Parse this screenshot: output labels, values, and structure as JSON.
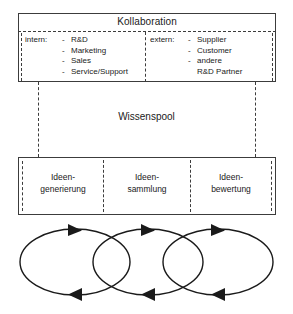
{
  "diagram": {
    "title": "Kollaboration",
    "collaboration": {
      "title": "Kollaboration",
      "internal": {
        "label": "intern:",
        "items": [
          "R&D",
          "Marketing",
          "Sales",
          "Service/Support"
        ]
      },
      "external": {
        "label": "extern:",
        "items": [
          "Supplier",
          "Customer",
          "andere"
        ],
        "continuation": "R&D Partner"
      }
    },
    "pool": {
      "label": "Wissenspool"
    },
    "phases": [
      {
        "line1": "Ideen-",
        "line2": "generierung"
      },
      {
        "line1": "Ideen-",
        "line2": "sammlung"
      },
      {
        "line1": "Ideen-",
        "line2": "bewertung"
      }
    ],
    "cycles": {
      "count": 3,
      "description": "drei überlappende Kreislauf-Ellipsen mit Pfeilspitzen"
    },
    "colors": {
      "line": "#3c3c3c",
      "text": "#1a1a1a",
      "background": "#ffffff"
    }
  }
}
